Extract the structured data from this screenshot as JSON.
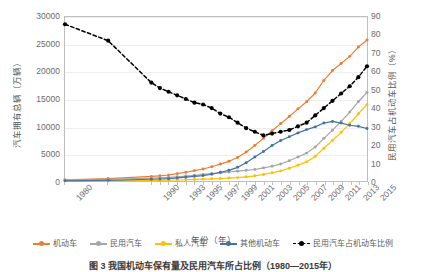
{
  "chart_data": {
    "type": "line",
    "title": "",
    "xlabel": "年份（年）",
    "ylabel": "汽车拥有总辆（万辆）",
    "y2label": "民用汽车占机动车比例（%）",
    "grid": true,
    "legend_position": "bottom",
    "ylim": [
      0,
      30000
    ],
    "y2lim": [
      0,
      90
    ],
    "ytick_labels": [
      "0",
      "5000",
      "10000",
      "15000",
      "20000",
      "25000",
      "30000"
    ],
    "ytick_values": [
      0,
      5000,
      10000,
      15000,
      20000,
      25000,
      30000
    ],
    "y2tick_labels": [
      "0",
      "10",
      "20",
      "30",
      "40",
      "50",
      "60",
      "70",
      "80",
      "90"
    ],
    "y2tick_values": [
      0,
      10,
      20,
      30,
      40,
      50,
      60,
      70,
      80,
      90
    ],
    "categories": [
      1980,
      1985,
      1990,
      1991,
      1992,
      1993,
      1994,
      1995,
      1996,
      1997,
      1998,
      1999,
      2000,
      2001,
      2002,
      2003,
      2004,
      2005,
      2006,
      2007,
      2008,
      2009,
      2010,
      2011,
      2012,
      2013,
      2014,
      2015
    ],
    "xtick_labels": [
      "1980",
      "1990",
      "1993",
      "1995",
      "1997",
      "1999",
      "2001",
      "2003",
      "2005",
      "2007",
      "2009",
      "2011",
      "2013",
      "2015"
    ],
    "xtick_values": [
      1980,
      1990,
      1993,
      1995,
      1997,
      1999,
      2001,
      2003,
      2005,
      2007,
      2009,
      2011,
      2013,
      2015
    ],
    "series": [
      {
        "name": "机动车",
        "color": "#ED7D31",
        "axis": "left",
        "values": [
          200,
          450,
          830,
          950,
          1100,
          1350,
          1600,
          1900,
          2200,
          2600,
          3100,
          3600,
          4300,
          5300,
          6500,
          7800,
          9200,
          10500,
          11800,
          13200,
          14500,
          16100,
          18400,
          20200,
          21500,
          22800,
          24500,
          25800
        ]
      },
      {
        "name": "民用汽车",
        "color": "#A5A5A5",
        "axis": "left",
        "values": [
          170,
          320,
          510,
          580,
          670,
          780,
          900,
          1040,
          1200,
          1360,
          1500,
          1650,
          1800,
          1950,
          2100,
          2400,
          2700,
          3100,
          3700,
          4400,
          5100,
          6200,
          7800,
          9300,
          10900,
          12600,
          14500,
          16200
        ]
      },
      {
        "name": "私人汽车",
        "color": "#FFC000",
        "axis": "left",
        "values": [
          30,
          50,
          90,
          110,
          140,
          180,
          230,
          280,
          340,
          400,
          460,
          530,
          620,
          770,
          950,
          1200,
          1500,
          1850,
          2330,
          2900,
          3500,
          4500,
          6000,
          7400,
          8900,
          10500,
          12300,
          14000
        ]
      },
      {
        "name": "其他机动车",
        "color": "#4472A4",
        "axis": "left",
        "values": [
          40,
          130,
          320,
          370,
          430,
          570,
          700,
          860,
          1000,
          1240,
          1600,
          1950,
          2500,
          3350,
          4400,
          5400,
          6500,
          7400,
          8100,
          8800,
          9400,
          9900,
          10600,
          10900,
          10600,
          10200,
          10000,
          9600
        ]
      },
      {
        "name": "民用汽车占机动车比例",
        "color": "#000000",
        "axis": "right",
        "style": "dashed",
        "values": [
          86,
          77,
          54,
          51,
          49,
          47,
          45,
          43,
          42,
          40,
          37,
          35,
          32,
          29,
          27,
          25,
          26,
          27,
          28,
          30,
          32,
          36,
          40,
          44,
          48,
          52,
          57,
          63
        ]
      }
    ]
  },
  "legend": {
    "items": [
      {
        "label": "机动车"
      },
      {
        "label": "民用汽车"
      },
      {
        "label": "私人汽车"
      },
      {
        "label": "其他机动车"
      },
      {
        "label": "民用汽车占机动车比例"
      }
    ]
  },
  "caption": "图 3  我国机动车保有量及民用汽车所占比例（1980—2015年）"
}
